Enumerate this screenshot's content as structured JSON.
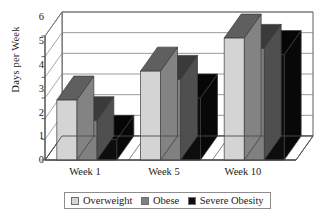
{
  "chart_data": {
    "type": "bar",
    "title": "",
    "subtitle": "",
    "xlabel": "",
    "ylabel": "Days per Week",
    "ylim": [
      0,
      6
    ],
    "yticks": [
      0,
      1,
      2,
      3,
      4,
      5,
      6
    ],
    "ytick_labels": [
      "0",
      "1",
      "2",
      "3",
      "4",
      "5",
      "6"
    ],
    "categories": [
      "Week 1",
      "Week 5",
      "Week 10"
    ],
    "series": [
      {
        "name": "Overweight",
        "color": "#d4d4d4",
        "values": [
          2.9,
          4.3,
          5.9
        ]
      },
      {
        "name": "Obese",
        "color": "#808080",
        "values": [
          1.9,
          3.9,
          5.4
        ]
      },
      {
        "name": "Severe Obesity",
        "color": "#0d0d0d",
        "values": [
          1.0,
          3.0,
          5.1
        ]
      }
    ],
    "grid": true,
    "grid_axis": "y",
    "legend_position": "bottom",
    "style": "3d-clustered-column",
    "annotations": []
  },
  "legend": {
    "items": [
      {
        "label": "Overweight",
        "color": "#d4d4d4"
      },
      {
        "label": "Obese",
        "color": "#808080"
      },
      {
        "label": "Severe Obesity",
        "color": "#0d0d0d"
      }
    ]
  },
  "colors": {
    "background": "#ffffff",
    "axis": "#4d4d4d",
    "gridline": "#808080",
    "text": "#1a1a1a",
    "wall": "#ffffff",
    "floor": "#9a9a9a"
  }
}
